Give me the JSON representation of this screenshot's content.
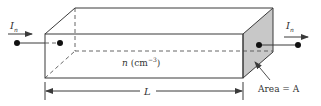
{
  "diagram": {
    "type": "semiconductor-bar-3d",
    "labels": {
      "current_in": {
        "symbol": "I",
        "subscript": "n"
      },
      "current_out": {
        "symbol": "I",
        "subscript": "n"
      },
      "concentration": {
        "symbol": "n",
        "unit": "(cm",
        "exponent": "−3",
        "close": ")"
      },
      "area": "Area = A",
      "length": "L"
    },
    "colors": {
      "stroke": "#3a3a3a",
      "dashed": "#555555",
      "shaded_face": "#c8c8c8",
      "text": "#333333",
      "background": "#ffffff"
    }
  }
}
